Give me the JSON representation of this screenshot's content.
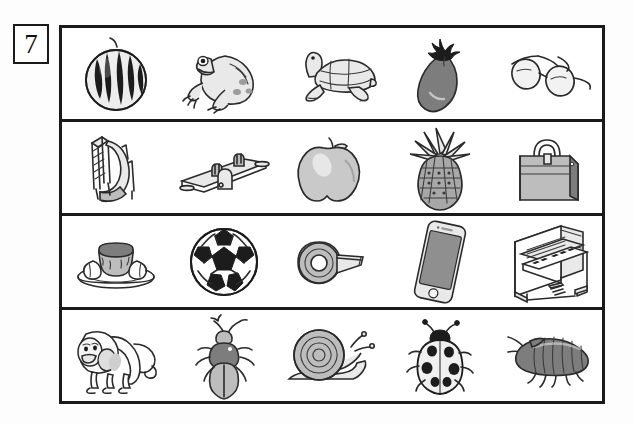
{
  "worksheet": {
    "question_number": "7",
    "rows": [
      {
        "row_label": "row-1",
        "items": [
          {
            "name": "watermelon",
            "icon": "watermelon-icon"
          },
          {
            "name": "frog",
            "icon": "frog-icon"
          },
          {
            "name": "turtle",
            "icon": "turtle-icon"
          },
          {
            "name": "eggplant",
            "icon": "eggplant-icon"
          },
          {
            "name": "eyeglasses",
            "icon": "eyeglasses-icon"
          }
        ]
      },
      {
        "row_label": "row-2",
        "items": [
          {
            "name": "playground slide",
            "icon": "slide-icon"
          },
          {
            "name": "seesaw",
            "icon": "seesaw-icon"
          },
          {
            "name": "apple",
            "icon": "apple-icon"
          },
          {
            "name": "pineapple",
            "icon": "pineapple-icon"
          },
          {
            "name": "handbag",
            "icon": "handbag-icon"
          }
        ]
      },
      {
        "row_label": "row-3",
        "items": [
          {
            "name": "pudding on plate",
            "icon": "pudding-icon"
          },
          {
            "name": "soccer ball",
            "icon": "soccer-ball-icon"
          },
          {
            "name": "tape dispenser roll",
            "icon": "tape-roll-icon"
          },
          {
            "name": "smartphone",
            "icon": "smartphone-icon"
          },
          {
            "name": "upright piano",
            "icon": "piano-icon"
          }
        ]
      },
      {
        "row_label": "row-4",
        "items": [
          {
            "name": "monkey",
            "icon": "monkey-icon"
          },
          {
            "name": "beetle",
            "icon": "beetle-icon"
          },
          {
            "name": "snail",
            "icon": "snail-icon"
          },
          {
            "name": "ladybug",
            "icon": "ladybug-icon"
          },
          {
            "name": "pill bug",
            "icon": "pillbug-icon"
          }
        ]
      }
    ]
  },
  "colors": {
    "ink": "#1a1a1a",
    "line": "#2a2a2a",
    "page": "#ffffff",
    "light_gray": "#e9e9e9",
    "mid_gray": "#bdbdbd",
    "dark_gray": "#7d7d7d",
    "black": "#1c1c1c"
  }
}
